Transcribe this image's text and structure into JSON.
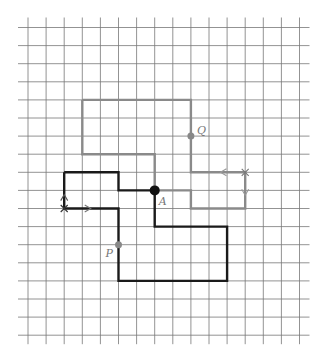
{
  "diagram": {
    "type": "grid-path-figure",
    "grid": {
      "origin_x": 28,
      "origin_y": 27.5,
      "step": 18.1,
      "cols": 16,
      "rows": 18,
      "line_color": "#777777",
      "line_width": 0.8
    },
    "shapes": [
      {
        "name": "gray-path",
        "color": "#8a8a8a",
        "width": 2.4,
        "points_grid": [
          [
            3,
            4
          ],
          [
            9,
            4
          ],
          [
            9,
            8
          ],
          [
            12,
            8
          ],
          [
            12,
            10
          ],
          [
            9,
            10
          ],
          [
            9,
            9
          ],
          [
            7,
            9
          ],
          [
            7,
            7
          ],
          [
            3,
            7
          ],
          [
            3,
            4
          ]
        ]
      },
      {
        "name": "black-path",
        "color": "#1a1a1a",
        "width": 2.4,
        "points_grid": [
          [
            2,
            8
          ],
          [
            5,
            8
          ],
          [
            5,
            9
          ],
          [
            7,
            9
          ],
          [
            7,
            11
          ],
          [
            11,
            11
          ],
          [
            11,
            14
          ],
          [
            5,
            14
          ],
          [
            5,
            10
          ],
          [
            2,
            10
          ],
          [
            2,
            8
          ]
        ]
      }
    ],
    "points": [
      {
        "label": "A",
        "grid": [
          7,
          9
        ],
        "color": "#111111",
        "radius": 5,
        "label_dx": 4,
        "label_dy": 15
      },
      {
        "label": "Q",
        "grid": [
          9,
          6
        ],
        "color": "#888888",
        "radius": 3.5,
        "label_dx": 6,
        "label_dy": -2
      },
      {
        "label": "P",
        "grid": [
          5,
          12
        ],
        "color": "#888888",
        "radius": 3.5,
        "label_dx": -13,
        "label_dy": 12
      }
    ],
    "markers": [
      {
        "type": "cross",
        "grid": [
          2,
          10
        ],
        "color": "#333333"
      },
      {
        "type": "arrow-up",
        "grid": [
          2,
          9.4
        ],
        "color": "#555555"
      },
      {
        "type": "arrow-right",
        "grid": [
          3.3,
          10
        ],
        "color": "#777777"
      },
      {
        "type": "cross",
        "grid": [
          12,
          8
        ],
        "color": "#777777"
      },
      {
        "type": "arrow-left",
        "grid": [
          10.8,
          8
        ],
        "color": "#999999"
      },
      {
        "type": "arrow-down",
        "grid": [
          12,
          9.1
        ],
        "color": "#999999"
      }
    ],
    "labels": {
      "A": "A",
      "P": "P",
      "Q": "Q"
    }
  }
}
